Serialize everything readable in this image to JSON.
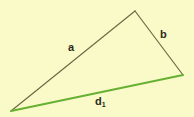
{
  "figure": {
    "kind": "geometry-diagram",
    "shape": "triangle",
    "background_color": "#fafac8",
    "labels": {
      "side_a": "a",
      "side_b": "b",
      "side_d_base": "d",
      "side_d_subscript": "1"
    },
    "colors": {
      "outline": "#6b6b47",
      "base_line": "#66b033",
      "label_text": "#2b2b20",
      "background": "#fafac8"
    },
    "vertices": {
      "bottom_left": {
        "x": 11,
        "y": 111
      },
      "apex": {
        "x": 135,
        "y": 11
      },
      "right": {
        "x": 183,
        "y": 75
      }
    },
    "edges": [
      {
        "name": "a",
        "from": "bottom_left",
        "to": "apex",
        "color": "#6b6b47",
        "width": 1.2,
        "label": "a"
      },
      {
        "name": "b",
        "from": "apex",
        "to": "right",
        "color": "#6b6b47",
        "width": 1.2,
        "label": "b"
      },
      {
        "name": "d1",
        "from": "bottom_left",
        "to": "right",
        "color": "#66b033",
        "width": 2.0,
        "label": "d1"
      }
    ]
  }
}
